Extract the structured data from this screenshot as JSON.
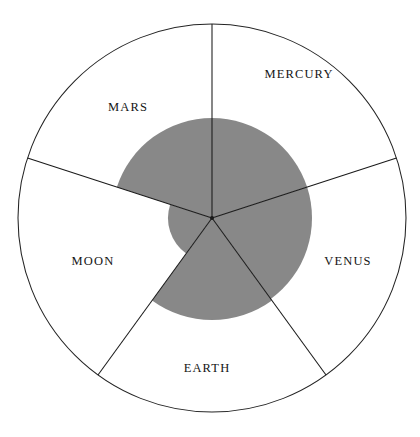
{
  "figure": {
    "type": "polar-area-chart",
    "background_color": "#ffffff",
    "outline_color": "#242424",
    "fill_color": "#888888",
    "label_color": "#141414"
  },
  "chart_data": {
    "type": "pie",
    "title": "",
    "subtitle": "",
    "xlabel": "",
    "ylabel": "",
    "legend_position": "none",
    "grid": false,
    "variant": "polar-area (Nightingale rose)",
    "outer_radius": 194,
    "max_value": 194,
    "center": {
      "x": 212,
      "y": 218
    },
    "sector_count": 5,
    "sector_angle_deg": 72,
    "start_angle_deg": -90,
    "categories": [
      "MERCURY",
      "VENUS",
      "EARTH",
      "MOON",
      "MARS"
    ],
    "values": [
      100,
      100,
      102,
      44,
      100
    ],
    "slices": [
      {
        "label": "MERCURY",
        "value": 100,
        "radius": 100,
        "start_angle_deg": -90,
        "end_angle_deg": -18,
        "filled": true,
        "fill_color": "#888888",
        "label_x": 299,
        "label_y": 75
      },
      {
        "label": "VENUS",
        "value": 100,
        "radius": 100,
        "start_angle_deg": -18,
        "end_angle_deg": 54,
        "filled": true,
        "fill_color": "#888888",
        "label_x": 348,
        "label_y": 262
      },
      {
        "label": "EARTH",
        "value": 102,
        "radius": 102,
        "start_angle_deg": 54,
        "end_angle_deg": 126,
        "filled": true,
        "fill_color": "#888888",
        "label_x": 207,
        "label_y": 369
      },
      {
        "label": "MOON",
        "value": 44,
        "radius": 44,
        "start_angle_deg": 126,
        "end_angle_deg": 198,
        "filled": true,
        "fill_color": "#888888",
        "label_x": 93,
        "label_y": 262
      },
      {
        "label": "MARS",
        "value": 100,
        "radius": 100,
        "start_angle_deg": 198,
        "end_angle_deg": 270,
        "filled": true,
        "fill_color": "#888888",
        "label_x": 128,
        "label_y": 108
      }
    ]
  }
}
